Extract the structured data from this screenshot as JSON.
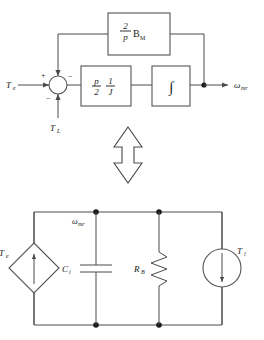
{
  "figure": {
    "equivalence_symbol": "double-headed-vertical-arrow"
  },
  "block_diagram": {
    "input_label": "T",
    "input_sub": "e",
    "disturbance_label": "T",
    "disturbance_sub": "L",
    "output_label": "ω",
    "output_sub": "mr",
    "summing_junction": {
      "name": "summing-junction",
      "sign_input_left": "+",
      "sign_feedback_top": "−",
      "sign_input_bottom": "−"
    },
    "blocks": [
      {
        "name": "feedback-gain-block",
        "numerator": "2",
        "denominator": "p",
        "factor": "B",
        "factor_sub": "M"
      },
      {
        "name": "gain-block",
        "term1_num": "p",
        "term1_den": "2",
        "term2_num": "1",
        "term2_den": "J"
      },
      {
        "name": "integrator-block",
        "symbol": "∫"
      }
    ]
  },
  "circuit": {
    "node_label": "ω",
    "node_sub": "mr",
    "elements": [
      {
        "name": "dependent-source-Te",
        "shape": "diamond",
        "label": "T",
        "label_sub": "e",
        "arrow_direction": "up"
      },
      {
        "name": "capacitor-Ci",
        "shape": "capacitor",
        "label": "C",
        "label_sub": "i"
      },
      {
        "name": "resistor-RB",
        "shape": "resistor",
        "label": "R",
        "label_sub": "B"
      },
      {
        "name": "current-source-Tl",
        "shape": "circle",
        "label": "T",
        "label_sub": "l",
        "arrow_direction": "down"
      }
    ]
  },
  "colors": {
    "line": "#4a4a4a",
    "box": "#555555",
    "text": "#1a1a1a",
    "background": "#ffffff"
  }
}
